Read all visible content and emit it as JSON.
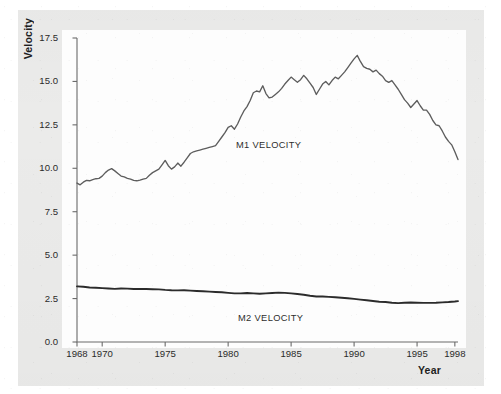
{
  "figure": {
    "background_color": "#ebebea",
    "plot_background_color": "#fdfdfd",
    "axis_color": "#6b6b6b",
    "m1_color": "#5d5d5d",
    "m2_color": "#2b2b2b"
  },
  "axes": {
    "ylabel": "Velocity",
    "xlabel": "Year",
    "yticks": [
      "0.0",
      "2.5",
      "5.0",
      "7.5",
      "10.0",
      "12.5",
      "15.0",
      "17.5"
    ],
    "xticks": [
      "1968",
      "1970",
      "1975",
      "1980",
      "1985",
      "1990",
      "1995",
      "1998"
    ]
  },
  "annotations": {
    "m1": "M1 VELOCITY",
    "m2": "M2 VELOCITY"
  },
  "chart_data": {
    "type": "line",
    "title": "",
    "subtitle": "",
    "xlabel": "Year",
    "ylabel": "Velocity",
    "xlim": [
      1968,
      1998.25
    ],
    "ylim": [
      0.0,
      17.5
    ],
    "xticks": [
      1968,
      1970,
      1975,
      1980,
      1985,
      1990,
      1995,
      1998
    ],
    "yticks": [
      0.0,
      2.5,
      5.0,
      7.5,
      10.0,
      12.5,
      15.0,
      17.5
    ],
    "grid": false,
    "legend": "inline-annotations",
    "annotations": [
      {
        "text": "M1 VELOCITY",
        "x": 1983.2,
        "y": 11.8
      },
      {
        "text": "M2 VELOCITY",
        "x": 1983.4,
        "y": 1.55
      }
    ],
    "series": [
      {
        "name": "M1 VELOCITY",
        "color": "#5d5d5d",
        "x": [
          1968.0,
          1968.25,
          1968.5,
          1968.75,
          1969.0,
          1969.25,
          1969.5,
          1969.75,
          1970.0,
          1970.25,
          1970.5,
          1970.75,
          1971.0,
          1971.25,
          1971.5,
          1971.75,
          1972.0,
          1972.25,
          1972.5,
          1972.75,
          1973.0,
          1973.25,
          1973.5,
          1973.75,
          1974.0,
          1974.25,
          1974.5,
          1974.75,
          1975.0,
          1975.25,
          1975.5,
          1975.75,
          1976.0,
          1976.25,
          1976.5,
          1976.75,
          1977.0,
          1977.25,
          1977.5,
          1977.75,
          1978.0,
          1978.25,
          1978.5,
          1978.75,
          1979.0,
          1979.25,
          1979.5,
          1979.75,
          1980.0,
          1980.25,
          1980.5,
          1980.75,
          1981.0,
          1981.25,
          1981.5,
          1981.75,
          1982.0,
          1982.25,
          1982.5,
          1982.75,
          1983.0,
          1983.25,
          1983.5,
          1983.75,
          1984.0,
          1984.25,
          1984.5,
          1984.75,
          1985.0,
          1985.25,
          1985.5,
          1985.75,
          1986.0,
          1986.25,
          1986.5,
          1986.75,
          1987.0,
          1987.25,
          1987.5,
          1987.75,
          1988.0,
          1988.25,
          1988.5,
          1988.75,
          1989.0,
          1989.25,
          1989.5,
          1989.75,
          1990.0,
          1990.25,
          1990.5,
          1990.75,
          1991.0,
          1991.25,
          1991.5,
          1991.75,
          1992.0,
          1992.25,
          1992.5,
          1992.75,
          1993.0,
          1993.25,
          1993.5,
          1993.75,
          1994.0,
          1994.25,
          1994.5,
          1994.75,
          1995.0,
          1995.25,
          1995.5,
          1995.75,
          1996.0,
          1996.25,
          1996.5,
          1996.75,
          1997.0,
          1997.25,
          1997.5,
          1997.75,
          1998.0,
          1998.25
        ],
        "y": [
          9.15,
          9.05,
          9.2,
          9.3,
          9.28,
          9.35,
          9.4,
          9.42,
          9.55,
          9.75,
          9.9,
          9.98,
          9.85,
          9.7,
          9.55,
          9.5,
          9.42,
          9.38,
          9.3,
          9.28,
          9.32,
          9.38,
          9.42,
          9.6,
          9.75,
          9.85,
          9.95,
          10.2,
          10.45,
          10.15,
          9.95,
          10.08,
          10.3,
          10.12,
          10.35,
          10.6,
          10.85,
          10.95,
          11.0,
          11.05,
          11.1,
          11.15,
          11.2,
          11.25,
          11.3,
          11.55,
          11.8,
          12.05,
          12.35,
          12.45,
          12.25,
          12.55,
          12.95,
          13.3,
          13.55,
          13.9,
          14.35,
          14.45,
          14.4,
          14.75,
          14.3,
          14.05,
          14.1,
          14.25,
          14.4,
          14.6,
          14.85,
          15.05,
          15.25,
          15.1,
          14.95,
          15.1,
          15.35,
          15.15,
          14.9,
          14.65,
          14.25,
          14.55,
          14.85,
          15.0,
          14.8,
          15.05,
          15.25,
          15.15,
          15.35,
          15.55,
          15.8,
          16.05,
          16.3,
          16.5,
          16.15,
          15.85,
          15.75,
          15.7,
          15.55,
          15.65,
          15.45,
          15.3,
          15.05,
          14.95,
          15.05,
          14.8,
          14.55,
          14.25,
          13.95,
          13.75,
          13.5,
          13.7,
          13.9,
          13.6,
          13.35,
          13.35,
          13.1,
          12.75,
          12.5,
          12.45,
          12.15,
          11.8,
          11.55,
          11.35,
          10.95,
          10.5
        ]
      },
      {
        "name": "M2 VELOCITY",
        "color": "#2b2b2b",
        "x": [
          1968.0,
          1968.5,
          1969.0,
          1969.5,
          1970.0,
          1970.5,
          1971.0,
          1971.5,
          1972.0,
          1972.5,
          1973.0,
          1973.5,
          1974.0,
          1974.5,
          1975.0,
          1975.5,
          1976.0,
          1976.5,
          1977.0,
          1977.5,
          1978.0,
          1978.5,
          1979.0,
          1979.5,
          1980.0,
          1980.5,
          1981.0,
          1981.5,
          1982.0,
          1982.5,
          1983.0,
          1983.5,
          1984.0,
          1984.5,
          1985.0,
          1985.5,
          1986.0,
          1986.5,
          1987.0,
          1987.5,
          1988.0,
          1988.5,
          1989.0,
          1989.5,
          1990.0,
          1990.5,
          1991.0,
          1991.5,
          1992.0,
          1992.5,
          1993.0,
          1993.5,
          1994.0,
          1994.5,
          1995.0,
          1995.5,
          1996.0,
          1996.5,
          1997.0,
          1997.5,
          1998.0,
          1998.25
        ],
        "y": [
          3.2,
          3.18,
          3.14,
          3.12,
          3.1,
          3.08,
          3.06,
          3.08,
          3.07,
          3.05,
          3.06,
          3.05,
          3.04,
          3.03,
          3.0,
          2.98,
          2.97,
          2.98,
          2.96,
          2.94,
          2.92,
          2.9,
          2.88,
          2.86,
          2.83,
          2.8,
          2.8,
          2.82,
          2.8,
          2.78,
          2.8,
          2.82,
          2.84,
          2.83,
          2.8,
          2.76,
          2.72,
          2.66,
          2.62,
          2.62,
          2.6,
          2.58,
          2.55,
          2.52,
          2.48,
          2.44,
          2.4,
          2.36,
          2.32,
          2.3,
          2.26,
          2.24,
          2.26,
          2.27,
          2.26,
          2.25,
          2.25,
          2.26,
          2.28,
          2.3,
          2.33,
          2.35
        ]
      }
    ]
  }
}
